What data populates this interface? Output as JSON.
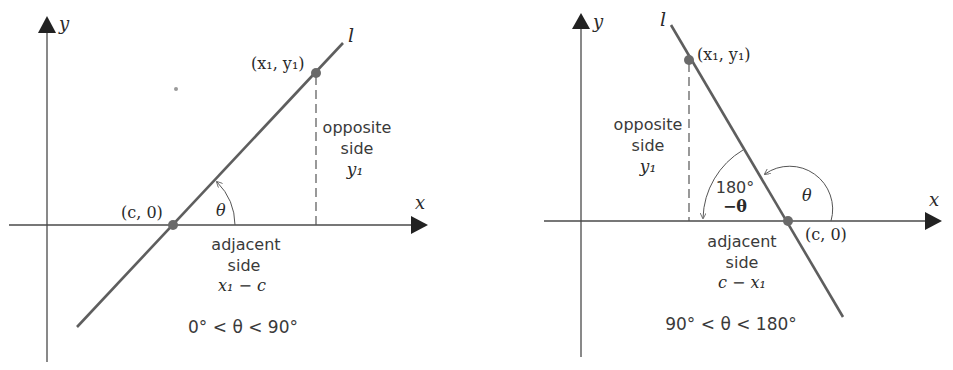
{
  "colors": {
    "line": "#5e5e5e",
    "axis": "#4a4a4a",
    "point": "#6a6a6a",
    "text": "#333333"
  },
  "left": {
    "y_label": "y",
    "x_label": "x",
    "line_label": "l",
    "point_top": "(x₁, y₁)",
    "point_axis": "(c, 0)",
    "angle": "θ",
    "opposite": [
      "opposite",
      "side",
      "y₁"
    ],
    "adjacent": [
      "adjacent",
      "side",
      "x₁ − c"
    ],
    "range": "0° < θ < 90°"
  },
  "right": {
    "y_label": "y",
    "x_label": "x",
    "line_label": "l",
    "point_top": "(x₁, y₁)",
    "point_axis": "(c, 0)",
    "angle": "θ",
    "supplement": [
      "180°",
      "−θ"
    ],
    "opposite": [
      "opposite",
      "side",
      "y₁"
    ],
    "adjacent": [
      "adjacent",
      "side",
      "c − x₁"
    ],
    "range": "90° < θ < 180°"
  }
}
